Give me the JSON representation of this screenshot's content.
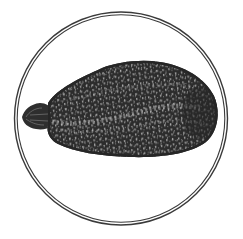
{
  "image": {
    "subject": "flatfish illustration in circular frame",
    "caption": "",
    "colors": {
      "background": "#ffffff",
      "ink": "#2f2f2f",
      "ink_dark": "#262626",
      "highlight": "#d9d9d9",
      "frame": "#3a3a3a"
    },
    "frame": {
      "cx": 121,
      "cy": 118.5,
      "outer_r": 106.5,
      "inner_r": 104
    }
  }
}
